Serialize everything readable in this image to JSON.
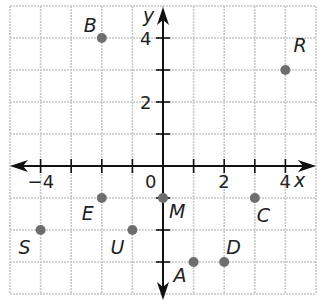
{
  "diagram": {
    "type": "coordinate-plane",
    "axes": {
      "x_label": "x",
      "y_label": "y",
      "origin_label": "0"
    },
    "x_range": [
      -5,
      5
    ],
    "y_range": [
      -4,
      5
    ],
    "x_tick_labels": [
      {
        "value": -4,
        "text": "−4"
      },
      {
        "value": 2,
        "text": "2"
      },
      {
        "value": 4,
        "text": "4"
      }
    ],
    "y_tick_labels": [
      {
        "value": 4,
        "text": "4"
      },
      {
        "value": 2,
        "text": "2"
      }
    ],
    "colors": {
      "grid": "#c8c8c8",
      "axis": "#111111",
      "point": "#6e6e6e",
      "text": "#222222"
    },
    "points": [
      {
        "name": "B",
        "x": -2,
        "y": 4,
        "label_dx": -18,
        "label_dy": -6
      },
      {
        "name": "R",
        "x": 4,
        "y": 3,
        "label_dx": 8,
        "label_dy": -18
      },
      {
        "name": "E",
        "x": -2,
        "y": -1,
        "label_dx": -20,
        "label_dy": 22
      },
      {
        "name": "S",
        "x": -4,
        "y": -2,
        "label_dx": -22,
        "label_dy": 24
      },
      {
        "name": "U",
        "x": -1,
        "y": -2,
        "label_dx": -22,
        "label_dy": 24
      },
      {
        "name": "M",
        "x": 0,
        "y": -1,
        "label_dx": 6,
        "label_dy": 20
      },
      {
        "name": "C",
        "x": 3,
        "y": -1,
        "label_dx": 2,
        "label_dy": 24
      },
      {
        "name": "A",
        "x": 1,
        "y": -3,
        "label_dx": -20,
        "label_dy": 20
      },
      {
        "name": "D",
        "x": 2,
        "y": -3,
        "label_dx": 2,
        "label_dy": -8
      }
    ]
  }
}
